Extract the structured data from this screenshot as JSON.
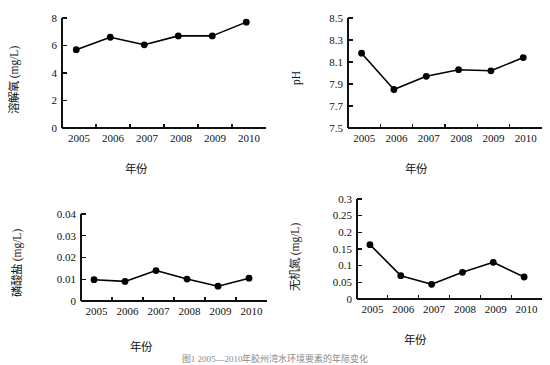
{
  "figure": {
    "background": "#ffffff",
    "line_color": "#000000",
    "marker_color": "#000000",
    "axis_color": "#111111",
    "caption": "图1  2005—2010年胶州湾水环境要素的年际变化"
  },
  "chart_data": [
    {
      "id": "dissolved-oxygen",
      "panel": "top-left",
      "type": "line",
      "title": "",
      "xlabel": "年份",
      "ylabel": "溶解氧 (mg/L)",
      "categories": [
        "2005",
        "2006",
        "2007",
        "2008",
        "2009",
        "2010"
      ],
      "x": [
        2005,
        2006,
        2007,
        2008,
        2009,
        2010
      ],
      "values": [
        5.7,
        6.6,
        6.05,
        6.7,
        6.7,
        7.7
      ],
      "yticks": [
        "0",
        "2",
        "4",
        "6",
        "8"
      ],
      "ytick_values": [
        0,
        2,
        4,
        6,
        8
      ],
      "ylim": [
        0,
        8
      ],
      "grid": false,
      "legend": "none",
      "marker": "filled-circle"
    },
    {
      "id": "ph",
      "panel": "top-right",
      "type": "line",
      "title": "",
      "xlabel": "年份",
      "ylabel": "pH",
      "categories": [
        "2005",
        "2006",
        "2007",
        "2008",
        "2009",
        "2010"
      ],
      "x": [
        2005,
        2006,
        2007,
        2008,
        2009,
        2010
      ],
      "values": [
        8.18,
        7.85,
        7.97,
        8.03,
        8.02,
        8.14
      ],
      "yticks": [
        "7.5",
        "7.7",
        "7.9",
        "8.1",
        "8.3",
        "8.5"
      ],
      "ytick_values": [
        7.5,
        7.7,
        7.9,
        8.1,
        8.3,
        8.5
      ],
      "ylim": [
        7.5,
        8.5
      ],
      "grid": false,
      "legend": "none",
      "marker": "filled-circle"
    },
    {
      "id": "phosphate",
      "panel": "bottom-left",
      "type": "line",
      "title": "",
      "xlabel": "年份",
      "ylabel": "磷酸盐 (mg/L)",
      "categories": [
        "2005",
        "2006",
        "2007",
        "2008",
        "2009",
        "2010"
      ],
      "x": [
        2005,
        2006,
        2007,
        2008,
        2009,
        2010
      ],
      "values": [
        0.0098,
        0.009,
        0.014,
        0.0101,
        0.0068,
        0.0105
      ],
      "yticks": [
        "0",
        "0.01",
        "0.02",
        "0.03",
        "0.04"
      ],
      "ytick_values": [
        0,
        0.01,
        0.02,
        0.03,
        0.04
      ],
      "ylim": [
        0,
        0.04
      ],
      "grid": false,
      "legend": "none",
      "marker": "filled-circle"
    },
    {
      "id": "inorganic-nitrogen",
      "panel": "bottom-right",
      "type": "line",
      "title": "",
      "xlabel": "年份",
      "ylabel": "无机氮 (mg/L)",
      "categories": [
        "2005",
        "2006",
        "2007",
        "2008",
        "2009",
        "2010"
      ],
      "x": [
        2005,
        2006,
        2007,
        2008,
        2009,
        2010
      ],
      "values": [
        0.163,
        0.07,
        0.044,
        0.08,
        0.11,
        0.066
      ],
      "yticks": [
        "0",
        "0.05",
        "0.1",
        "0.15",
        "0.2",
        "0.25",
        "0.3"
      ],
      "ytick_values": [
        0,
        0.05,
        0.1,
        0.15,
        0.2,
        0.25,
        0.3
      ],
      "ylim": [
        0,
        0.3
      ],
      "grid": false,
      "legend": "none",
      "marker": "filled-circle"
    }
  ],
  "panels": {
    "tl": {
      "ylabel": "溶解氧 (mg/L)",
      "xlabel": "年份"
    },
    "tr": {
      "ylabel": "pH",
      "xlabel": "年份"
    },
    "bl": {
      "ylabel": "磷酸盐 (mg/L)",
      "xlabel": "年份"
    },
    "br": {
      "ylabel": "无机氮 (mg/L)",
      "xlabel": "年份"
    }
  }
}
